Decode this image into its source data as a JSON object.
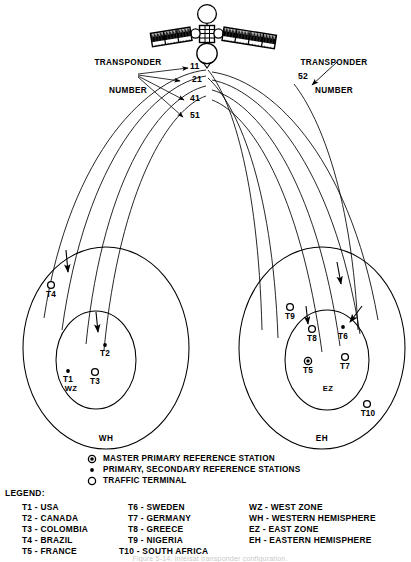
{
  "figure": {
    "title_caption": "Figure 5-14. Intelsat transponder configuration.",
    "satellite": {
      "name": "intelsat-satellite",
      "body_label": "",
      "panels": 2,
      "antennas": 2
    },
    "annotations": {
      "left_transponder_label_line1": "TRANSPONDER",
      "left_transponder_label_line2": "NUMBER",
      "right_transponder_label_line1": "TRANSPONDER",
      "right_transponder_label_line2": "NUMBER"
    },
    "transponder_numbers": {
      "left": [
        "11",
        "21",
        "41",
        "51"
      ],
      "right": [
        "52"
      ]
    },
    "hemispheres": [
      {
        "code": "WH",
        "name": "western-hemisphere",
        "zone": {
          "code": "WZ",
          "name": "west-zone",
          "terminals": [
            {
              "id": "T1",
              "type": "primary",
              "x": 68,
              "y": 371
            },
            {
              "id": "T2",
              "type": "primary",
              "x": 105,
              "y": 345
            },
            {
              "id": "T3",
              "type": "traffic",
              "x": 95,
              "y": 372
            }
          ]
        },
        "outer_terminals": [
          {
            "id": "T4",
            "type": "traffic",
            "x": 51,
            "y": 285
          }
        ]
      },
      {
        "code": "EH",
        "name": "eastern-hemisphere",
        "zone": {
          "code": "EZ",
          "name": "east-zone",
          "terminals": [
            {
              "id": "T5",
              "type": "master",
              "x": 308,
              "y": 361
            },
            {
              "id": "T6",
              "type": "primary",
              "x": 343,
              "y": 327
            },
            {
              "id": "T7",
              "type": "traffic",
              "x": 345,
              "y": 357
            },
            {
              "id": "T8",
              "type": "traffic",
              "x": 312,
              "y": 329
            }
          ]
        },
        "outer_terminals": [
          {
            "id": "T9",
            "type": "traffic",
            "x": 290,
            "y": 307
          },
          {
            "id": "T10",
            "type": "traffic",
            "x": 367,
            "y": 404
          }
        ]
      }
    ]
  },
  "legend": {
    "title": "LEGEND:",
    "symbols": [
      {
        "symbol": "master",
        "label": "MASTER PRIMARY REFERENCE STATION"
      },
      {
        "symbol": "primary",
        "label": "PRIMARY, SECONDARY REFERENCE STATIONS"
      },
      {
        "symbol": "traffic",
        "label": "TRAFFIC TERMINAL"
      }
    ],
    "column1": [
      "T1 - USA",
      "T2 - CANADA",
      "T3 - COLOMBIA",
      "T4 - BRAZIL",
      "T5 - FRANCE"
    ],
    "column2": [
      "T6 - SWEDEN",
      "T7 - GERMANY",
      "T8 - GREECE",
      "T9 - NIGERIA",
      "T10 - SOUTH AFRICA"
    ],
    "column3": [
      "WZ - WEST ZONE",
      "WH - WESTERN HEMISPHERE",
      "EZ - EAST ZONE",
      "EH - EASTERN HEMISPHERE"
    ]
  },
  "colors": {
    "ink": "#000000",
    "background": "#ffffff",
    "caption": "#c8c8c8"
  }
}
